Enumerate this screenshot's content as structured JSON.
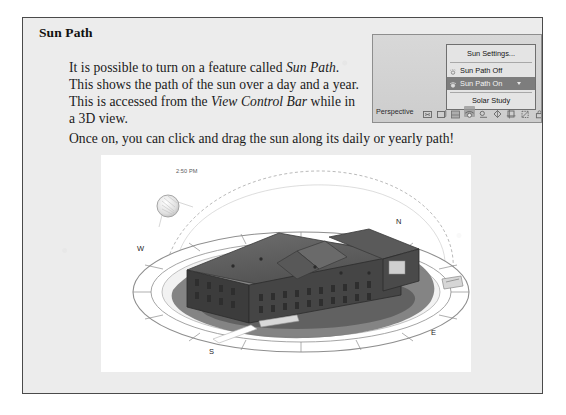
{
  "document": {
    "heading": "Sun Path",
    "paragraph_1_parts": {
      "t1": "It is possible to turn on a feature called ",
      "i1": "Sun Path",
      "t2": ". This shows the path of the sun over a day and a year. This is accessed from the ",
      "i2": "View Control Bar",
      "t3": " while in a 3D view."
    },
    "paragraph_2": "Once on, you can click and drag the sun along its daily or yearly path!"
  },
  "inset": {
    "menu": {
      "items": [
        {
          "label": "Sun Settings...",
          "selected": false,
          "centered": true,
          "icon": "none",
          "has_caret": false
        },
        {
          "label": "Sun Path Off",
          "selected": false,
          "centered": false,
          "icon": "sun-path-off-icon",
          "has_caret": false
        },
        {
          "label": "Sun Path On",
          "selected": true,
          "centered": false,
          "icon": "sun-path-on-icon",
          "has_caret": true
        },
        {
          "label": "Solar Study",
          "selected": false,
          "centered": true,
          "icon": "none",
          "has_caret": false
        }
      ]
    },
    "view_control_bar": {
      "label": "Perspective",
      "icons": [
        "scale-icon",
        "detail-level-icon",
        "visual-style-icon",
        "sun-path-toggle-icon",
        "shadows-toggle-icon",
        "render-icon",
        "crop-view-icon",
        "hide-crop-icon",
        "lock-3d-view-icon",
        "temporary-hide-isolate-icon",
        "reveal-hidden-elements-icon"
      ],
      "active_icon_index": 3
    }
  },
  "view3d": {
    "compass": {
      "north": "N",
      "west": "W",
      "south": "S",
      "east": "E"
    },
    "date_label": "May 10",
    "time_label": "2:50 PM"
  },
  "colors": {
    "page_background": "#ffffff",
    "paper": "#ececec",
    "frame_border": "#4a4a4a",
    "menu_background": "#e4e4e4",
    "menu_highlight": "#7d7d7d",
    "view_background": "#ffffff",
    "building_dark": "#3b3b3b",
    "ground_shadow": "#6d6d6d"
  }
}
